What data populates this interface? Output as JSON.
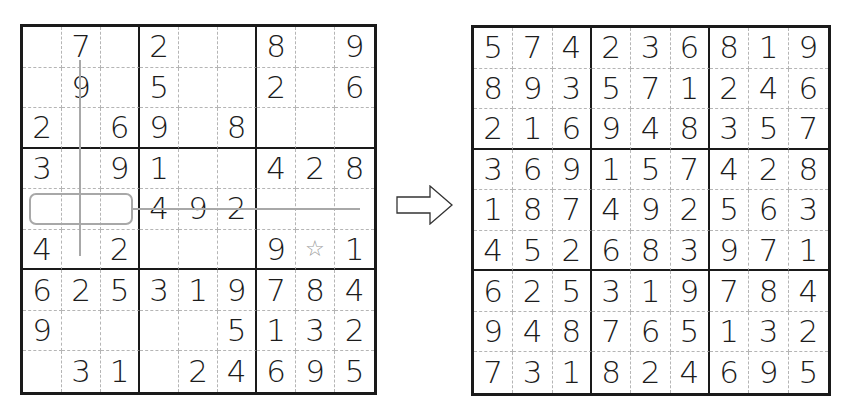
{
  "puzzle": {
    "title": "sudoku-puzzle",
    "cells": [
      [
        "",
        "7",
        "",
        "2",
        "",
        "",
        "8",
        "",
        "9"
      ],
      [
        "",
        "9",
        "",
        "5",
        "",
        "",
        "2",
        "",
        "6"
      ],
      [
        "2",
        "",
        "6",
        "9",
        "",
        "8",
        "",
        "",
        ""
      ],
      [
        "3",
        "",
        "9",
        "1",
        "",
        "",
        "4",
        "2",
        "8"
      ],
      [
        "",
        "",
        "",
        "4",
        "9",
        "2",
        "",
        "",
        ""
      ],
      [
        "4",
        "",
        "2",
        "",
        "",
        "",
        "9",
        "☆",
        "1"
      ],
      [
        "6",
        "2",
        "5",
        "3",
        "1",
        "9",
        "7",
        "8",
        "4"
      ],
      [
        "9",
        "",
        "",
        "",
        "",
        "5",
        "1",
        "3",
        "2"
      ],
      [
        "",
        "3",
        "1",
        "",
        "2",
        "4",
        "6",
        "9",
        "5"
      ]
    ],
    "star_cell": {
      "row": 5,
      "col": 7,
      "icon": "star-outline-icon"
    },
    "annotations": {
      "vertical_line_col": 1,
      "horizontal_line_row": 4,
      "highlighted_box": {
        "row": 4,
        "cols": [
          0,
          1,
          2
        ]
      }
    },
    "line_color": "#a8a8a8"
  },
  "arrow": {
    "icon": "right-arrow-icon"
  },
  "solution": {
    "title": "sudoku-solution",
    "cells": [
      [
        "5",
        "7",
        "4",
        "2",
        "3",
        "6",
        "8",
        "1",
        "9"
      ],
      [
        "8",
        "9",
        "3",
        "5",
        "7",
        "1",
        "2",
        "4",
        "6"
      ],
      [
        "2",
        "1",
        "6",
        "9",
        "4",
        "8",
        "3",
        "5",
        "7"
      ],
      [
        "3",
        "6",
        "9",
        "1",
        "5",
        "7",
        "4",
        "2",
        "8"
      ],
      [
        "1",
        "8",
        "7",
        "4",
        "9",
        "2",
        "5",
        "6",
        "3"
      ],
      [
        "4",
        "5",
        "2",
        "6",
        "8",
        "3",
        "9",
        "7",
        "1"
      ],
      [
        "6",
        "2",
        "5",
        "3",
        "1",
        "9",
        "7",
        "8",
        "4"
      ],
      [
        "9",
        "4",
        "8",
        "7",
        "6",
        "5",
        "1",
        "3",
        "2"
      ],
      [
        "7",
        "3",
        "1",
        "8",
        "2",
        "4",
        "6",
        "9",
        "5"
      ]
    ]
  }
}
